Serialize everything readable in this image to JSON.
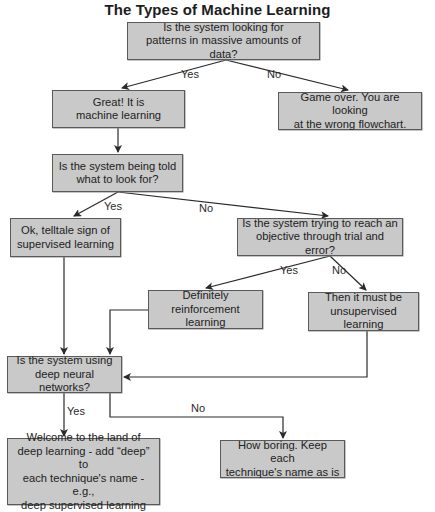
{
  "title": "The Types of Machine Learning",
  "nodes": {
    "q_patterns": "Is the system looking for\npatterns in massive amounts of data?",
    "ml_yes": "Great! It is\nmachine learning",
    "game_over": "Game over. You are looking\nat the wrong flowchart.",
    "q_told": "Is the system being told\nwhat to look for?",
    "supervised": "Ok, telltale sign of\nsupervised learning",
    "q_trial": "Is the system trying to reach an\nobjective through trial and error?",
    "reinforcement": "Definitely\nreinforcement learning",
    "unsupervised": "Then it must be\nunsupervised learning",
    "q_deep": "Is the system using\ndeep neural networks?",
    "deep_yes": "Welcome to the land of\ndeep learning - add “deep” to\neach technique's name - e.g.,\ndeep supervised learning",
    "deep_no": "How boring. Keep each\ntechnique's name as is"
  },
  "edge_labels": {
    "patterns_yes": "Yes",
    "patterns_no": "No",
    "told_yes": "Yes",
    "told_no": "No",
    "trial_yes": "Yes",
    "trial_no": "No",
    "deep_yes": "Yes",
    "deep_no": "No"
  },
  "colors": {
    "box_fill": "#c9c9c9",
    "box_border": "#5a5a5a",
    "line": "#2a2a2a"
  }
}
